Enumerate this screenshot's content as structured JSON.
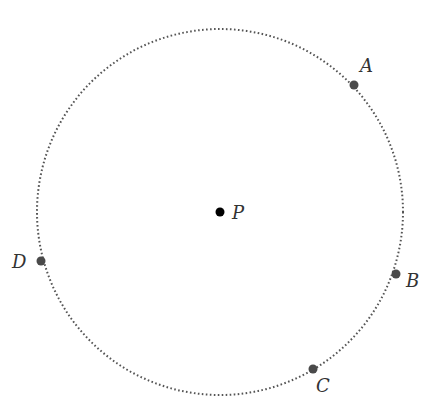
{
  "diagram": {
    "type": "circle-with-points",
    "circle": {
      "center": {
        "x": 220,
        "y": 212
      },
      "radius": 183,
      "stroke_style": "dotted",
      "stroke_color": "#555555"
    },
    "center_point": {
      "label": "P",
      "x": 220,
      "y": 212,
      "color": "#000000"
    },
    "points": [
      {
        "label": "A",
        "x": 354,
        "y": 85,
        "label_x": 360,
        "label_y": 72
      },
      {
        "label": "B",
        "x": 396,
        "y": 274,
        "label_x": 406,
        "label_y": 287
      },
      {
        "label": "C",
        "x": 313,
        "y": 369,
        "label_x": 316,
        "label_y": 392
      },
      {
        "label": "D",
        "x": 41,
        "y": 261,
        "label_x": 12,
        "label_y": 268
      }
    ],
    "point_color": "#4a4a4a"
  }
}
